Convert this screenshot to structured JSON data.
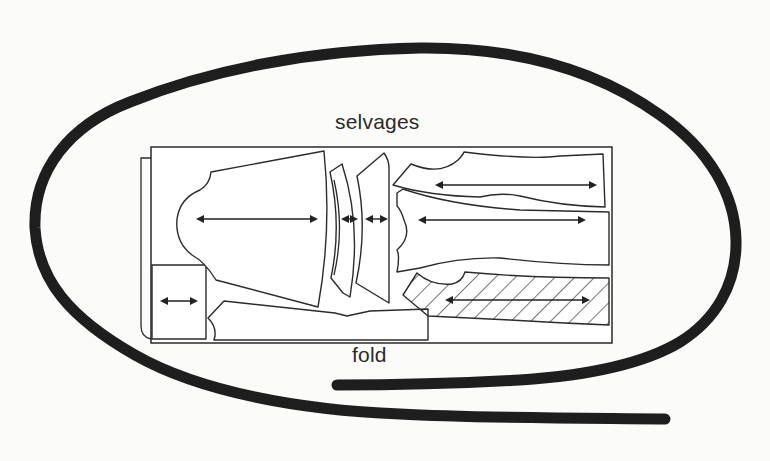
{
  "diagram": {
    "type": "sewing-pattern-layout",
    "labels": {
      "top_edge": "selvages",
      "bottom_edge": "fold"
    },
    "pieces": [
      {
        "id": "sleeve",
        "grainline": "horizontal",
        "hatched": false
      },
      {
        "id": "cuff-curved",
        "grainline": "horizontal",
        "hatched": false
      },
      {
        "id": "cuff-trapezoid",
        "grainline": "horizontal",
        "hatched": false
      },
      {
        "id": "upper-long-piece",
        "grainline": "horizontal",
        "hatched": false
      },
      {
        "id": "middle-long-piece",
        "grainline": "horizontal",
        "hatched": false
      },
      {
        "id": "hatched-long-piece",
        "grainline": "horizontal",
        "hatched": true
      },
      {
        "id": "small-rectangle",
        "grainline": "horizontal",
        "hatched": false
      },
      {
        "id": "bottom-strip",
        "grainline": "none",
        "hatched": false
      }
    ],
    "annotation": "hand-drawn loop encircling the layout",
    "colors": {
      "background": "#fbfbfa",
      "lines": "#2b2b2b",
      "loop": "#1e1e1e"
    }
  }
}
